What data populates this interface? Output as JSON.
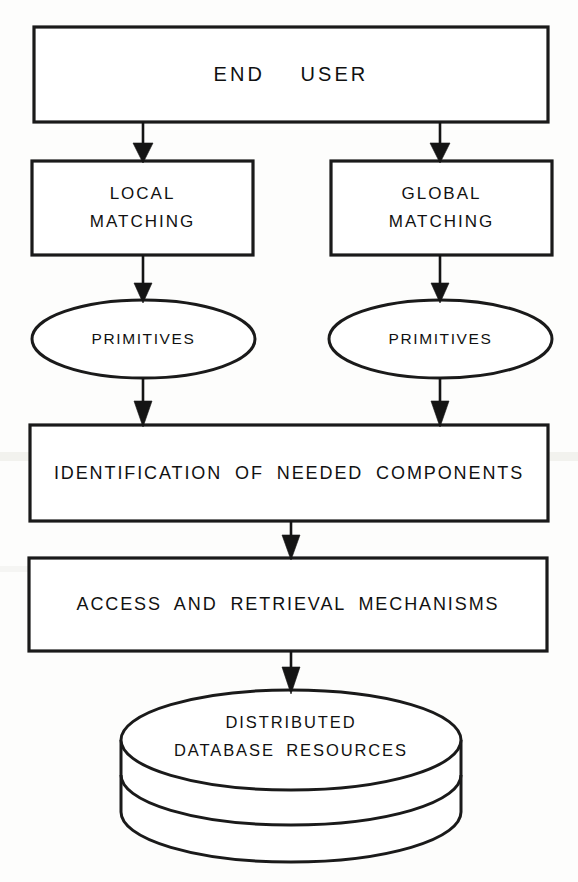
{
  "diagram": {
    "type": "flowchart",
    "background_color": "#ffffff",
    "stroke_color": "#141414",
    "text_color": "#111111",
    "nodes": [
      {
        "id": "end_user",
        "shape": "rectangle",
        "label": "END USER",
        "lines": [
          "END  USER"
        ],
        "x": 34,
        "y": 27,
        "w": 514,
        "h": 95
      },
      {
        "id": "local_matching",
        "shape": "rectangle",
        "label": "LOCAL MATCHING",
        "lines": [
          "LOCAL",
          "MATCHING"
        ],
        "x": 32,
        "y": 161,
        "w": 221,
        "h": 94
      },
      {
        "id": "global_matching",
        "shape": "rectangle",
        "label": "GLOBAL MATCHING",
        "lines": [
          "GLOBAL",
          "MATCHING"
        ],
        "x": 331,
        "y": 161,
        "w": 221,
        "h": 94
      },
      {
        "id": "primitives_left",
        "shape": "ellipse",
        "label": "PRIMITIVES",
        "lines": [
          "PRIMITIVES"
        ],
        "x": 32,
        "y": 300,
        "w": 223,
        "h": 78
      },
      {
        "id": "primitives_right",
        "shape": "ellipse",
        "label": "PRIMITIVES",
        "lines": [
          "PRIMITIVES"
        ],
        "x": 329,
        "y": 300,
        "w": 223,
        "h": 78
      },
      {
        "id": "identification",
        "shape": "rectangle",
        "label": "IDENTIFICATION OF NEEDED COMPONENTS",
        "lines": [
          "IDENTIFICATION OF NEEDED COMPONENTS"
        ],
        "x": 30,
        "y": 425,
        "w": 518,
        "h": 96
      },
      {
        "id": "access_retrieval",
        "shape": "rectangle",
        "label": "ACCESS AND RETRIEVAL MECHANISMS",
        "lines": [
          "ACCESS AND RETRIEVAL MECHANISMS"
        ],
        "x": 29,
        "y": 558,
        "w": 518,
        "h": 93
      },
      {
        "id": "database",
        "shape": "cylinder",
        "label": "DISTRIBUTED DATABASE RESOURCES",
        "lines": [
          "DISTRIBUTED",
          "DATABASE RESOURCES"
        ],
        "x": 121,
        "y": 690,
        "w": 340,
        "h": 172
      }
    ],
    "edges": [
      {
        "id": "e1",
        "from": "end_user",
        "to": "local_matching",
        "arrow": "down"
      },
      {
        "id": "e2",
        "from": "end_user",
        "to": "global_matching",
        "arrow": "down"
      },
      {
        "id": "e3",
        "from": "local_matching",
        "to": "primitives_left",
        "arrow": "down"
      },
      {
        "id": "e4",
        "from": "global_matching",
        "to": "primitives_right",
        "arrow": "down"
      },
      {
        "id": "e5",
        "from": "primitives_left",
        "to": "identification",
        "arrow": "down"
      },
      {
        "id": "e6",
        "from": "primitives_right",
        "to": "identification",
        "arrow": "down"
      },
      {
        "id": "e7",
        "from": "identification",
        "to": "access_retrieval",
        "arrow": "down"
      },
      {
        "id": "e8",
        "from": "access_retrieval",
        "to": "database",
        "arrow": "down"
      }
    ]
  }
}
